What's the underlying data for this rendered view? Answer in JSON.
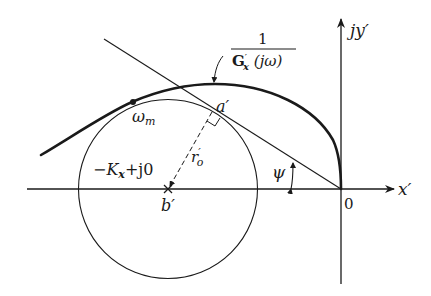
{
  "figure": {
    "type": "nyquist-inverse-polar-plot",
    "colors": {
      "ink": "#1a1a1a",
      "background": "#ffffff"
    },
    "axes": {
      "x_label": "x′",
      "y_label": "jy′",
      "origin_label": "0"
    },
    "curve": {
      "label_numerator": "1",
      "label_denominator_main": "G",
      "label_denominator_prime": "′",
      "label_denominator_sub": "x",
      "label_denominator_arg": " (jω)"
    },
    "points": {
      "omega_m": "ω",
      "omega_m_sub": "m",
      "tangent_point": "a′",
      "center": "b′"
    },
    "center_label": {
      "minus_k": "−K",
      "k_sub": "x",
      "plus_j0": "+j0"
    },
    "radius_label": {
      "r": "r",
      "prime": "′",
      "sub": "o"
    },
    "angle_label": "ψ"
  }
}
